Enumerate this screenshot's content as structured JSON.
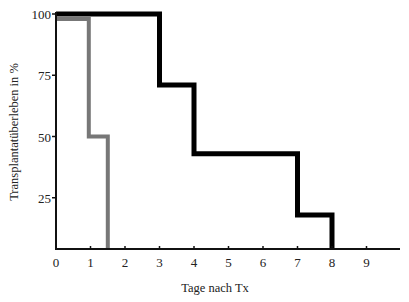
{
  "chart_data": {
    "type": "line",
    "subtype": "step (Kaplan-Meier survival)",
    "title": "",
    "xlabel": "Tage nach Tx",
    "ylabel": "Transplantatüberleben in %",
    "xlim": [
      0,
      10
    ],
    "ylim": [
      5,
      100
    ],
    "x_ticks": [
      "0",
      "1",
      "2",
      "3",
      "4",
      "5",
      "6",
      "7",
      "8",
      "9"
    ],
    "y_ticks": [
      "25",
      "50",
      "75",
      "100"
    ],
    "grid": false,
    "legend": null,
    "series": [
      {
        "name": "black",
        "color": "#000000",
        "x": [
          0,
          3,
          3,
          4,
          4,
          7,
          7,
          8,
          8
        ],
        "y": [
          100,
          100,
          71,
          71,
          43,
          43,
          18,
          18,
          0
        ]
      },
      {
        "name": "gray",
        "color": "#777777",
        "x": [
          0,
          0.95,
          0.95,
          1.5,
          1.5
        ],
        "y": [
          98,
          98,
          50,
          50,
          0
        ]
      }
    ]
  }
}
